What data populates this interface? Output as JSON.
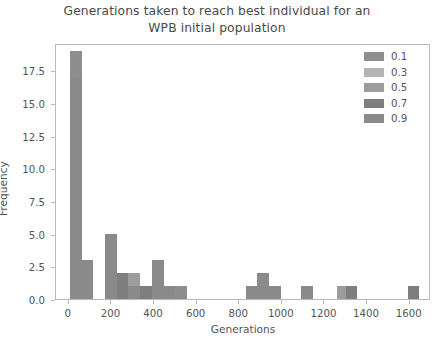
{
  "chart_data": {
    "type": "bar",
    "subtype": "overlapping-histogram",
    "title": "Generations taken to reach best individual for an\nWPB initial population",
    "xlabel": "Generations",
    "ylabel": "Frequency",
    "xlim": [
      -60,
      1700
    ],
    "ylim": [
      0,
      19.6
    ],
    "xticks": [
      0,
      200,
      400,
      600,
      800,
      1000,
      1200,
      1400,
      1600
    ],
    "yticks": [
      0.0,
      2.5,
      5.0,
      7.5,
      10.0,
      12.5,
      15.0,
      17.5
    ],
    "ytick_labels": [
      "0.0",
      "2.5",
      "5.0",
      "7.5",
      "10.0",
      "12.5",
      "15.0",
      "17.5"
    ],
    "xtick_labels": [
      "0",
      "200",
      "400",
      "600",
      "800",
      "1000",
      "1200",
      "1400",
      "1600"
    ],
    "grid": false,
    "legend_position": "upper right",
    "legend_title": "",
    "bin_width": 55,
    "series": [
      {
        "name": "0.1",
        "color": "#8d8d8d",
        "bins": [
          {
            "x": 5,
            "value": 19
          },
          {
            "x": 60,
            "value": 3
          },
          {
            "x": 170,
            "value": 1
          },
          {
            "x": 280,
            "value": 1
          },
          {
            "x": 335,
            "value": 1
          },
          {
            "x": 390,
            "value": 1
          },
          {
            "x": 500,
            "value": 1
          },
          {
            "x": 1590,
            "value": 1
          }
        ]
      },
      {
        "name": "0.3",
        "color": "#b5b5b5",
        "bins": [
          {
            "x": 5,
            "value": 17
          },
          {
            "x": 60,
            "value": 3
          },
          {
            "x": 170,
            "value": 5
          },
          {
            "x": 280,
            "value": 2
          },
          {
            "x": 390,
            "value": 3
          },
          {
            "x": 830,
            "value": 1
          },
          {
            "x": 885,
            "value": 2
          }
        ]
      },
      {
        "name": "0.5",
        "color": "#9c9c9c",
        "bins": [
          {
            "x": 5,
            "value": 17
          },
          {
            "x": 60,
            "value": 3
          },
          {
            "x": 225,
            "value": 2
          },
          {
            "x": 280,
            "value": 2
          },
          {
            "x": 390,
            "value": 2
          },
          {
            "x": 445,
            "value": 1
          },
          {
            "x": 940,
            "value": 1
          },
          {
            "x": 1090,
            "value": 1
          },
          {
            "x": 1260,
            "value": 1
          }
        ]
      },
      {
        "name": "0.7",
        "color": "#7e7e7e",
        "bins": [
          {
            "x": 5,
            "value": 17
          },
          {
            "x": 60,
            "value": 3
          },
          {
            "x": 170,
            "value": 5
          },
          {
            "x": 225,
            "value": 2
          },
          {
            "x": 335,
            "value": 1
          },
          {
            "x": 390,
            "value": 3
          },
          {
            "x": 1300,
            "value": 1
          },
          {
            "x": 1590,
            "value": 1
          }
        ]
      },
      {
        "name": "0.9",
        "color": "#8a8a8a",
        "bins": [
          {
            "x": 5,
            "value": 17
          },
          {
            "x": 60,
            "value": 3
          },
          {
            "x": 170,
            "value": 5
          },
          {
            "x": 280,
            "value": 1
          },
          {
            "x": 390,
            "value": 3
          },
          {
            "x": 445,
            "value": 1
          },
          {
            "x": 830,
            "value": 1
          },
          {
            "x": 885,
            "value": 2
          },
          {
            "x": 940,
            "value": 1
          },
          {
            "x": 1090,
            "value": 1
          }
        ]
      }
    ],
    "legend_entries": [
      {
        "label": "0.1",
        "color": "#8d8d8d"
      },
      {
        "label": "0.3",
        "color": "#b5b5b5"
      },
      {
        "label": "0.5",
        "color": "#9c9c9c"
      },
      {
        "label": "0.7",
        "color": "#7e7e7e"
      },
      {
        "label": "0.9",
        "color": "#8a8a8a"
      }
    ]
  },
  "style": {
    "background": "#ffffff",
    "axis_color": "#b9b9b9",
    "text_color": "#545454",
    "title_color": "#4a4a4a"
  }
}
